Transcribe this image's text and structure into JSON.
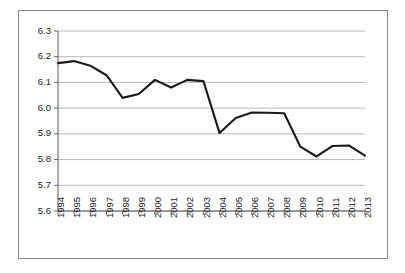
{
  "chart_data": {
    "type": "line",
    "title": "",
    "subtitle": "",
    "xlabel": "",
    "ylabel": "",
    "categories": [
      "1994",
      "1995",
      "1996",
      "1997",
      "1998",
      "1999",
      "2000",
      "2001",
      "2002",
      "2003",
      "2004",
      "2005",
      "2006",
      "2007",
      "2008",
      "2009",
      "2010",
      "2011",
      "2012",
      "2013"
    ],
    "x": [
      1994,
      1995,
      1996,
      1997,
      1998,
      1999,
      2000,
      2001,
      2002,
      2003,
      2004,
      2005,
      2006,
      2007,
      2008,
      2009,
      2010,
      2011,
      2012,
      2013
    ],
    "values": [
      6.175,
      6.183,
      6.165,
      6.128,
      6.04,
      6.055,
      6.11,
      6.08,
      6.11,
      6.105,
      5.903,
      5.962,
      5.983,
      5.982,
      5.98,
      5.85,
      5.812,
      5.853,
      5.855,
      5.815
    ],
    "series": [
      {
        "name": "series-1",
        "values": [
          6.175,
          6.183,
          6.165,
          6.128,
          6.04,
          6.055,
          6.11,
          6.08,
          6.11,
          6.105,
          5.903,
          5.962,
          5.983,
          5.982,
          5.98,
          5.85,
          5.812,
          5.853,
          5.855,
          5.815
        ],
        "color": "#1a1a1a"
      }
    ],
    "ylim": [
      5.6,
      6.3
    ],
    "xlim": [
      1994,
      2013
    ],
    "ytick_labels": [
      "6.3",
      "6.2",
      "6.1",
      "6.0",
      "5.9",
      "5.8",
      "5.7",
      "5.6"
    ],
    "ytick_values": [
      6.3,
      6.2,
      6.1,
      6.0,
      5.9,
      5.8,
      5.7,
      5.6
    ],
    "grid": true,
    "grid_axis": "y",
    "legend": false,
    "legend_position": "none",
    "markers": false,
    "annotations": [],
    "line_color": "#1a1a1a",
    "grid_color": "#a6a6a6",
    "axis_color": "#5a5a5a",
    "plot_background": "#ffffff",
    "border_color": "#8a8a8a",
    "xtick_rotation": -90
  }
}
